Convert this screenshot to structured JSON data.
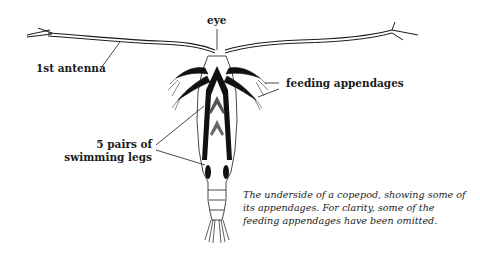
{
  "diagram": {
    "labels": {
      "eye": "eye",
      "antenna": "1st antenna",
      "feeding": "feeding appendages",
      "swimming_line1": "5 pairs of",
      "swimming_line2": "swimming legs"
    },
    "caption": {
      "line1": "The underside of a copepod, showing some of",
      "line2": "its appendages. For clarity, some of the",
      "line3": "feeding appendages have been omitted."
    },
    "colors": {
      "ink": "#1a1a1a",
      "background": "#ffffff"
    }
  }
}
